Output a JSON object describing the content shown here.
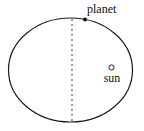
{
  "diagram": {
    "background_color": "#ffffff",
    "stroke_color": "#1a1a1a",
    "labels": {
      "planet": "planet",
      "sun": "sun"
    },
    "orbit": {
      "shape": "ellipse",
      "center_x": 70.5,
      "center_y": 70,
      "radius_x": 62,
      "radius_y": 52,
      "stroke_width": 1.2,
      "fill": "none"
    },
    "axis_line": {
      "style": "dashed",
      "x": 72,
      "y_top": 19,
      "y_bottom": 122,
      "dash_pattern": "2,3",
      "stroke_width": 1
    },
    "planet_marker": {
      "shape": "filled-dot",
      "x": 85,
      "y": 19.5,
      "radius": 2,
      "fill": "#111111"
    },
    "sun_marker": {
      "shape": "open-circle",
      "x": 111.5,
      "y": 67.5,
      "radius": 2.6,
      "fill": "none",
      "stroke_width": 1
    }
  }
}
